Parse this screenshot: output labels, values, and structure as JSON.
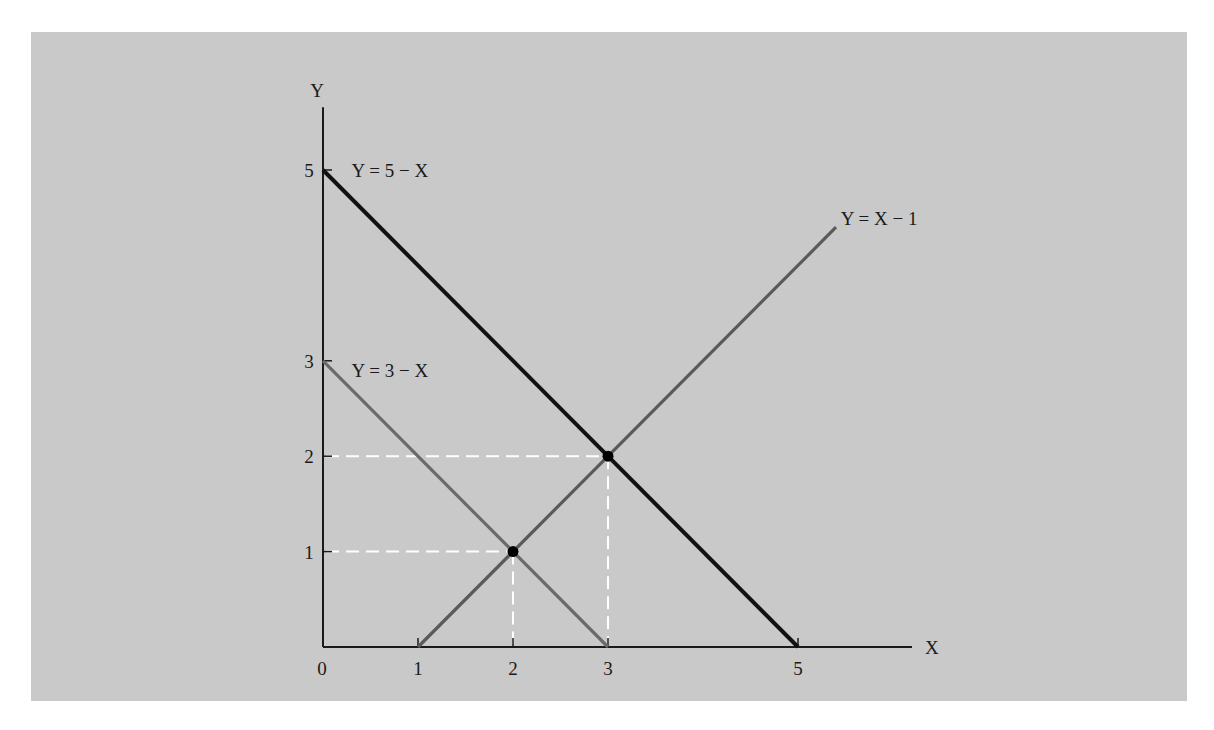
{
  "chart_data": {
    "type": "line",
    "title": "",
    "xlabel": "X",
    "ylabel": "Y",
    "xlim": [
      0,
      6.2
    ],
    "ylim": [
      0,
      5.5
    ],
    "grid": false,
    "legend": "none",
    "x_ticks": [
      {
        "value": 0,
        "label": "0"
      },
      {
        "value": 1,
        "label": "1"
      },
      {
        "value": 2,
        "label": "2"
      },
      {
        "value": 3,
        "label": "3"
      },
      {
        "value": 5,
        "label": "5"
      }
    ],
    "y_ticks": [
      {
        "value": 1,
        "label": "1"
      },
      {
        "value": 2,
        "label": "2"
      },
      {
        "value": 3,
        "label": "3"
      },
      {
        "value": 5,
        "label": "5"
      }
    ],
    "series": [
      {
        "name": "Y = 5 − X",
        "points": [
          [
            0,
            5
          ],
          [
            5,
            0
          ]
        ],
        "color": "#111111",
        "weight": "heavy",
        "label_anchor": [
          0.3,
          5.0
        ]
      },
      {
        "name": "Y = 3 − X",
        "points": [
          [
            0,
            3
          ],
          [
            3,
            0
          ]
        ],
        "color": "#6a6a6a",
        "weight": "medium",
        "label_anchor": [
          0.3,
          2.9
        ]
      },
      {
        "name": "Y = X − 1",
        "points": [
          [
            1,
            0
          ],
          [
            5.4,
            4.4
          ]
        ],
        "color": "#5a5a5a",
        "weight": "medium",
        "label_anchor": [
          5.45,
          4.5
        ]
      }
    ],
    "intersections": [
      {
        "x": 2,
        "y": 1
      },
      {
        "x": 3,
        "y": 2
      }
    ],
    "guide_lines_color": "#ffffff",
    "background": "#c9c9c9"
  }
}
